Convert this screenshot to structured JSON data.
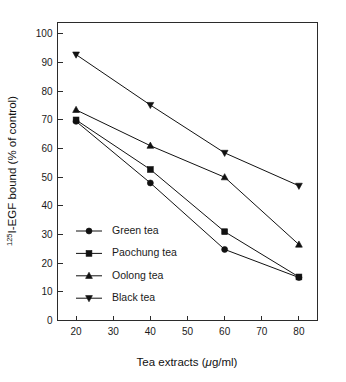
{
  "chart_data": {
    "type": "line",
    "title": "",
    "subtitle": "",
    "xlabel": "Tea extracts (μg/ml)",
    "ylabel": "125I-EGF bound (% of control)",
    "ylabel_prefix_sup": "125",
    "ylabel_rest": "I-EGF bound (% of control)",
    "xlabel_pre": "Tea extracts (",
    "xlabel_mu": "μ",
    "xlabel_post": "g/ml)",
    "x": [
      20,
      40,
      60,
      80
    ],
    "xlim": [
      15,
      85
    ],
    "ylim": [
      0,
      104
    ],
    "xticks": [
      20,
      30,
      40,
      50,
      60,
      70,
      80
    ],
    "xtick_labels": [
      "20",
      "30",
      "40",
      "50",
      "60",
      "70",
      "80"
    ],
    "yticks": [
      0,
      10,
      20,
      30,
      40,
      50,
      60,
      70,
      80,
      90,
      100
    ],
    "ytick_labels": [
      "0",
      "10",
      "20",
      "30",
      "40",
      "50",
      "60",
      "70",
      "80",
      "90",
      "100"
    ],
    "grid": false,
    "legend_position": "lower-left-inside",
    "frame": true,
    "series": [
      {
        "name": "Green tea",
        "marker": "circle",
        "color": "#111111",
        "values": [
          69.5,
          48.0,
          24.8,
          15.0
        ]
      },
      {
        "name": "Paochung tea",
        "marker": "square",
        "color": "#111111",
        "values": [
          70.0,
          52.7,
          31.0,
          15.2
        ]
      },
      {
        "name": "Oolong tea",
        "marker": "triangle-up",
        "color": "#111111",
        "values": [
          73.5,
          61.0,
          50.0,
          26.5
        ]
      },
      {
        "name": "Black tea",
        "marker": "triangle-down",
        "color": "#111111",
        "values": [
          92.8,
          75.2,
          58.5,
          47.0
        ]
      }
    ]
  },
  "legend": {
    "items": [
      {
        "label": "Green tea",
        "marker": "circle"
      },
      {
        "label": "Paochung tea",
        "marker": "square"
      },
      {
        "label": "Oolong tea",
        "marker": "triangle-up"
      },
      {
        "label": "Black tea",
        "marker": "triangle-down"
      }
    ]
  }
}
